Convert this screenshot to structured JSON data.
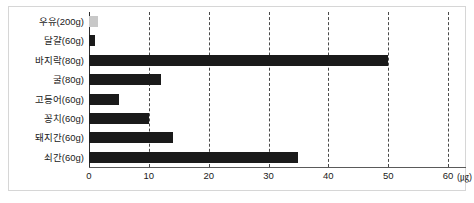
{
  "chart_data": {
    "type": "bar",
    "orientation": "horizontal",
    "title": "",
    "xlabel": "(㎍)",
    "ylabel": "",
    "categories": [
      "우유(200g)",
      "달걀(60g)",
      "바지락(80g)",
      "굴(80g)",
      "고등어(60g)",
      "꽁치(60g)",
      "돼지간(60g)",
      "쇠간(60g)"
    ],
    "values": [
      1.5,
      1.0,
      50.0,
      12.0,
      5.0,
      10.0,
      14.0,
      35.0
    ],
    "bar_colors": [
      "#c8c8c8",
      "#1a1a1a",
      "#1a1a1a",
      "#1a1a1a",
      "#1a1a1a",
      "#1a1a1a",
      "#1a1a1a",
      "#1a1a1a"
    ],
    "xlim": [
      0,
      63
    ],
    "xticks": [
      0,
      10,
      20,
      30,
      40,
      50,
      60
    ],
    "xtick_labels": [
      "0",
      "10",
      "20",
      "30",
      "40",
      "50",
      "60"
    ],
    "unit_label": "(㎍)",
    "grid": true,
    "gridline_values": [
      10,
      20,
      30,
      40,
      50,
      60
    ],
    "gridline_style": "dashed",
    "legend": "none",
    "axis_color": "#2b2b2b",
    "grid_color": "#4a4a4a",
    "background_color": "#ffffff",
    "frame_color": "#d6d6d6"
  }
}
